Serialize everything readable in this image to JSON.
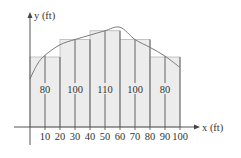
{
  "chart_data": {
    "type": "bar",
    "title": "",
    "xlabel": "x (ft)",
    "ylabel": "y (ft)",
    "x_ticks": [
      10,
      20,
      30,
      40,
      50,
      60,
      70,
      80,
      90,
      100
    ],
    "bins": [
      {
        "x0": 0,
        "x1": 20,
        "height": 80,
        "label": "80",
        "label_x": 10
      },
      {
        "x0": 20,
        "x1": 40,
        "height": 100,
        "label": "100",
        "label_x": 30
      },
      {
        "x0": 40,
        "x1": 60,
        "height": 110,
        "label": "110",
        "label_x": 50
      },
      {
        "x0": 60,
        "x1": 80,
        "height": 100,
        "label": "100",
        "label_x": 70
      },
      {
        "x0": 80,
        "x1": 100,
        "height": 80,
        "label": "80",
        "label_x": 90
      }
    ],
    "vertical_lines_at": [
      10,
      20,
      30,
      40,
      50,
      60,
      70,
      80,
      90,
      100
    ],
    "curve": {
      "description": "smooth cross-section boundary curve",
      "points": [
        [
          0,
          55
        ],
        [
          5,
          72
        ],
        [
          10,
          82
        ],
        [
          20,
          94
        ],
        [
          30,
          100
        ],
        [
          40,
          105
        ],
        [
          50,
          110
        ],
        [
          60,
          114
        ],
        [
          70,
          100
        ],
        [
          80,
          91
        ],
        [
          90,
          81
        ],
        [
          100,
          68
        ]
      ]
    },
    "xlim": [
      0,
      100
    ],
    "ylim": [
      0,
      120
    ],
    "grid": false,
    "legend": null
  },
  "colors": {
    "bar_fill": "#ececec",
    "bar_stroke": "#b8b8b8",
    "line": "#555555",
    "curve": "#7a7a7a",
    "text": "#333333"
  }
}
